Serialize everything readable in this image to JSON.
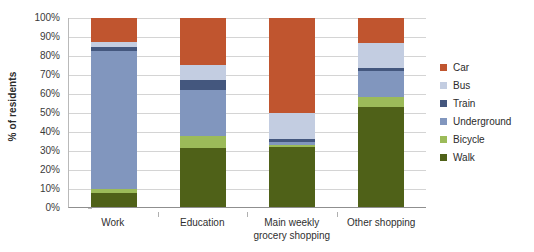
{
  "chart_data": {
    "type": "bar",
    "title": "",
    "subtitle": "",
    "xlabel": "",
    "ylabel": "% of residents",
    "ylim": [
      0,
      100
    ],
    "ytick_labels": [
      "100%",
      "90%",
      "80%",
      "70%",
      "60%",
      "50%",
      "40%",
      "30%",
      "20%",
      "10%",
      "0%"
    ],
    "ytick_values": [
      100,
      90,
      80,
      70,
      60,
      50,
      40,
      30,
      20,
      10,
      0
    ],
    "grid": true,
    "stacked": true,
    "legend_position": "right",
    "categories": [
      "Work",
      "Education",
      "Main weekly grocery shopping",
      "Other shopping"
    ],
    "category_label_lines": [
      [
        "Work"
      ],
      [
        "Education"
      ],
      [
        "Main weekly",
        "grocery shopping"
      ],
      [
        "Other shopping"
      ]
    ],
    "legend_order": [
      "Car",
      "Bus",
      "Train",
      "Underground",
      "Bicycle",
      "Walk"
    ],
    "series": [
      {
        "name": "Walk",
        "color": "#4F6118",
        "values": [
          7.5,
          31.0,
          32.0,
          53.0
        ]
      },
      {
        "name": "Bicycle",
        "color": "#9CBB59",
        "values": [
          2.0,
          6.5,
          1.0,
          5.0
        ]
      },
      {
        "name": "Underground",
        "color": "#8196BE",
        "values": [
          73.0,
          24.5,
          1.5,
          14.0
        ]
      },
      {
        "name": "Train",
        "color": "#44577E",
        "values": [
          2.0,
          5.0,
          1.5,
          1.5
        ]
      },
      {
        "name": "Bus",
        "color": "#C3CDE1",
        "values": [
          3.0,
          8.0,
          13.5,
          13.5
        ]
      },
      {
        "name": "Car",
        "color": "#C0552F",
        "values": [
          12.5,
          25.0,
          50.5,
          13.0
        ]
      }
    ],
    "cumulative_tops": {
      "Work": {
        "Walk": 7.5,
        "Bicycle": 9.5,
        "Underground": 82.5,
        "Train": 84.5,
        "Bus": 87.5,
        "Car": 100
      },
      "Education": {
        "Walk": 31.0,
        "Bicycle": 37.5,
        "Underground": 62.0,
        "Train": 67.0,
        "Bus": 75.0,
        "Car": 100
      },
      "Main weekly grocery shopping": {
        "Walk": 32.0,
        "Bicycle": 33.0,
        "Underground": 34.5,
        "Train": 36.0,
        "Bus": 49.5,
        "Car": 100
      },
      "Other shopping": {
        "Walk": 53.0,
        "Bicycle": 58.0,
        "Underground": 72.0,
        "Train": 73.5,
        "Bus": 87.0,
        "Car": 100
      }
    }
  },
  "colors": {
    "car": "#C0552F",
    "bus": "#C3CDE1",
    "train": "#44577E",
    "underground": "#8196BE",
    "bicycle": "#9CBB59",
    "walk": "#4F6118",
    "gridline": "#d4d4d4",
    "axis": "#8f8f8f",
    "text": "#2b2b2b",
    "background": "#ffffff"
  }
}
